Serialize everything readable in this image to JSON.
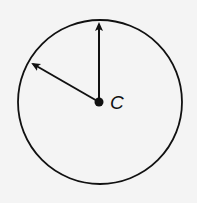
{
  "diagram": {
    "center_label": "C",
    "colors": {
      "stroke": "#111111",
      "background": "#f4f4f4"
    },
    "circle": {
      "cx": 100,
      "cy": 102,
      "r": 82
    },
    "vectors": [
      {
        "name": "vertical-radius",
        "from": [
          99,
          102
        ],
        "to": [
          99,
          22
        ]
      },
      {
        "name": "upper-left-radius",
        "from": [
          99,
          102
        ],
        "to": [
          31,
          63
        ]
      }
    ]
  }
}
